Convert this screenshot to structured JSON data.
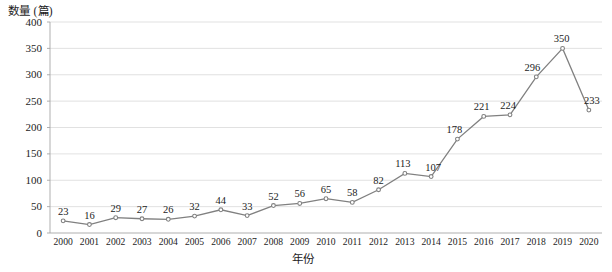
{
  "chart_data": {
    "type": "line",
    "title": "",
    "ylabel": "数量 (篇)",
    "xlabel": "年份",
    "categories": [
      "2000",
      "2001",
      "2002",
      "2003",
      "2004",
      "2005",
      "2006",
      "2007",
      "2008",
      "2009",
      "2010",
      "2011",
      "2012",
      "2013",
      "2014",
      "2015",
      "2016",
      "2017",
      "2018",
      "2019",
      "2020"
    ],
    "values": [
      23,
      16,
      29,
      27,
      26,
      32,
      44,
      33,
      52,
      56,
      65,
      58,
      82,
      113,
      107,
      178,
      221,
      224,
      296,
      350,
      233
    ],
    "series": [
      {
        "name": "数量 (篇)",
        "values": [
          23,
          16,
          29,
          27,
          26,
          32,
          44,
          33,
          52,
          56,
          65,
          58,
          82,
          113,
          107,
          178,
          221,
          224,
          296,
          350,
          233
        ]
      }
    ],
    "yticks": [
      "0",
      "50",
      "100",
      "150",
      "200",
      "250",
      "300",
      "350",
      "400"
    ],
    "ytick_values": [
      0,
      50,
      100,
      150,
      200,
      250,
      300,
      350,
      400
    ],
    "ylim": [
      0,
      400
    ],
    "grid": true,
    "legend": "none",
    "data_labels": [
      "23",
      "16",
      "29",
      "27",
      "26",
      "32",
      "44",
      "33",
      "52",
      "56",
      "65",
      "58",
      "82",
      "113",
      "107",
      "178",
      "221",
      "224",
      "296",
      "350",
      "233"
    ],
    "line_color": "#808080",
    "marker_color": "#808080",
    "grid_color": "#d9d9d9",
    "axis_color": "#a6a6a6"
  }
}
